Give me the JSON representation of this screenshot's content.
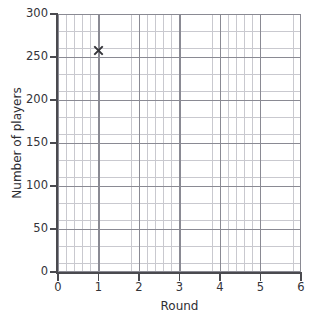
{
  "chart_data": {
    "type": "scatter",
    "title": "",
    "xlabel": "Round",
    "ylabel": "Number of players",
    "xlim": [
      0,
      6
    ],
    "ylim": [
      0,
      300
    ],
    "x_ticks": [
      "0",
      "1",
      "2",
      "3",
      "4",
      "5",
      "6"
    ],
    "y_ticks": [
      "0",
      "50",
      "100",
      "150",
      "200",
      "250",
      "300"
    ],
    "x_tick_values": [
      0,
      1,
      2,
      3,
      4,
      5,
      6
    ],
    "y_tick_values": [
      0,
      50,
      100,
      150,
      200,
      250,
      300
    ],
    "grid": true,
    "grid_minor": true,
    "legend": "none",
    "marker": "x",
    "points": [
      {
        "x": 1,
        "y": 257,
        "label": "x"
      }
    ],
    "series": [
      {
        "name": "players",
        "x": [
          1
        ],
        "values": [
          257
        ]
      }
    ]
  },
  "colors": {
    "background": "#ffffff",
    "axis": "#4a4a4f",
    "grid_major": "#8a8a93",
    "grid_minor": "#c9c9cf",
    "marker": "#35353a",
    "text": "#2e2e33"
  }
}
